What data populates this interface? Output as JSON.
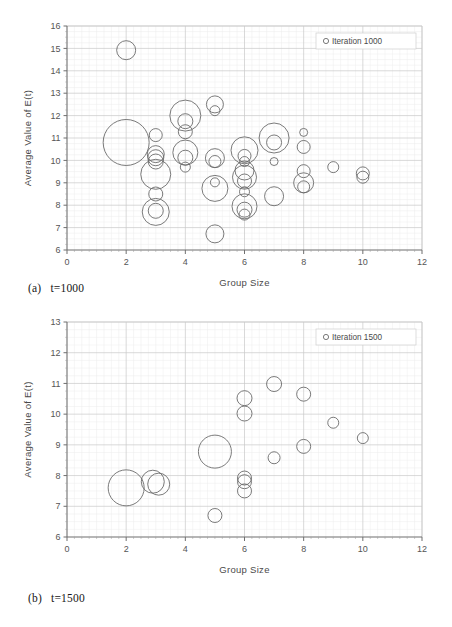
{
  "figure": {
    "panels": [
      {
        "id": "a",
        "caption_index": "(a)",
        "caption_text": "t=1000"
      },
      {
        "id": "b",
        "caption_index": "(b)",
        "caption_text": "t=1500"
      }
    ]
  },
  "chart_data": [
    {
      "type": "scatter",
      "title": "",
      "subtitle": "",
      "xlabel": "Group Size",
      "ylabel": "Average Value of E(t)",
      "xlim": [
        0,
        12
      ],
      "ylim": [
        6,
        16
      ],
      "xticks": [
        0,
        2,
        4,
        6,
        8,
        10,
        12
      ],
      "yticks": [
        6,
        7,
        8,
        9,
        10,
        11,
        12,
        13,
        14,
        15,
        16
      ],
      "grid": true,
      "minor_grid": true,
      "legend": [
        "Iteration 1000"
      ],
      "legend_position": "top-right",
      "marker": "open-circle",
      "series": [
        {
          "name": "Iteration 1000",
          "points": [
            {
              "x": 2,
              "y": 14.92,
              "r": 9.5
            },
            {
              "x": 2,
              "y": 10.8,
              "r": 23.0
            },
            {
              "x": 3,
              "y": 11.13,
              "r": 6.5
            },
            {
              "x": 3,
              "y": 10.28,
              "r": 8.5
            },
            {
              "x": 3,
              "y": 10.12,
              "r": 8.0
            },
            {
              "x": 3,
              "y": 9.95,
              "r": 7.5
            },
            {
              "x": 3,
              "y": 9.38,
              "r": 15.0
            },
            {
              "x": 3,
              "y": 8.5,
              "r": 7.0
            },
            {
              "x": 3,
              "y": 7.75,
              "r": 7.5
            },
            {
              "x": 3,
              "y": 7.7,
              "r": 13.5
            },
            {
              "x": 4,
              "y": 12.0,
              "r": 15.5
            },
            {
              "x": 4,
              "y": 11.75,
              "r": 7.5
            },
            {
              "x": 4,
              "y": 11.28,
              "r": 7.0
            },
            {
              "x": 4,
              "y": 10.35,
              "r": 12.5
            },
            {
              "x": 4,
              "y": 10.12,
              "r": 7.5
            },
            {
              "x": 4,
              "y": 9.7,
              "r": 5.0
            },
            {
              "x": 5,
              "y": 12.5,
              "r": 8.5
            },
            {
              "x": 5,
              "y": 12.22,
              "r": 5.0
            },
            {
              "x": 5,
              "y": 10.1,
              "r": 9.5
            },
            {
              "x": 5,
              "y": 9.95,
              "r": 6.0
            },
            {
              "x": 5,
              "y": 8.75,
              "r": 13.0
            },
            {
              "x": 5,
              "y": 9.02,
              "r": 4.5
            },
            {
              "x": 5,
              "y": 6.72,
              "r": 9.0
            },
            {
              "x": 6,
              "y": 10.45,
              "r": 13.5
            },
            {
              "x": 6,
              "y": 10.2,
              "r": 6.5
            },
            {
              "x": 6,
              "y": 9.95,
              "r": 5.0
            },
            {
              "x": 6,
              "y": 9.55,
              "r": 9.5
            },
            {
              "x": 6,
              "y": 9.25,
              "r": 12.0
            },
            {
              "x": 6,
              "y": 9.08,
              "r": 7.0
            },
            {
              "x": 6,
              "y": 8.6,
              "r": 5.0
            },
            {
              "x": 6,
              "y": 7.95,
              "r": 12.5
            },
            {
              "x": 6,
              "y": 7.8,
              "r": 7.5
            },
            {
              "x": 6,
              "y": 7.58,
              "r": 5.5
            },
            {
              "x": 7,
              "y": 11.0,
              "r": 15.0
            },
            {
              "x": 7,
              "y": 10.8,
              "r": 7.5
            },
            {
              "x": 7,
              "y": 9.95,
              "r": 4.0
            },
            {
              "x": 7,
              "y": 8.4,
              "r": 9.5
            },
            {
              "x": 8,
              "y": 11.25,
              "r": 4.0
            },
            {
              "x": 8,
              "y": 10.6,
              "r": 6.5
            },
            {
              "x": 8,
              "y": 9.52,
              "r": 6.5
            },
            {
              "x": 8,
              "y": 9.0,
              "r": 10.0
            },
            {
              "x": 8,
              "y": 8.82,
              "r": 6.0
            },
            {
              "x": 9,
              "y": 9.7,
              "r": 5.5
            },
            {
              "x": 10,
              "y": 9.42,
              "r": 6.5
            },
            {
              "x": 10,
              "y": 9.25,
              "r": 6.0
            }
          ]
        }
      ]
    },
    {
      "type": "scatter",
      "title": "",
      "subtitle": "",
      "xlabel": "Group Size",
      "ylabel": "Average Value of E(t)",
      "xlim": [
        0,
        12
      ],
      "ylim": [
        6,
        13
      ],
      "xticks": [
        0,
        2,
        4,
        6,
        8,
        10,
        12
      ],
      "yticks": [
        6,
        7,
        8,
        9,
        10,
        11,
        12,
        13
      ],
      "grid": true,
      "minor_grid": true,
      "legend": [
        "Iteration 1500"
      ],
      "legend_position": "top-right",
      "marker": "open-circle",
      "series": [
        {
          "name": "Iteration 1500",
          "points": [
            {
              "x": 2,
              "y": 7.6,
              "r": 18.0
            },
            {
              "x": 2.9,
              "y": 7.8,
              "r": 11.5
            },
            {
              "x": 3.1,
              "y": 7.72,
              "r": 11.0
            },
            {
              "x": 5,
              "y": 8.78,
              "r": 16.5
            },
            {
              "x": 5,
              "y": 6.7,
              "r": 7.0
            },
            {
              "x": 6,
              "y": 10.52,
              "r": 7.5
            },
            {
              "x": 6,
              "y": 10.02,
              "r": 7.5
            },
            {
              "x": 6,
              "y": 7.92,
              "r": 7.0
            },
            {
              "x": 6,
              "y": 7.8,
              "r": 7.0
            },
            {
              "x": 6,
              "y": 7.5,
              "r": 7.0
            },
            {
              "x": 7,
              "y": 10.98,
              "r": 7.5
            },
            {
              "x": 7,
              "y": 8.58,
              "r": 6.0
            },
            {
              "x": 8,
              "y": 10.65,
              "r": 7.0
            },
            {
              "x": 8,
              "y": 8.95,
              "r": 7.0
            },
            {
              "x": 9,
              "y": 9.72,
              "r": 5.5
            },
            {
              "x": 10,
              "y": 9.22,
              "r": 5.5
            }
          ]
        }
      ]
    }
  ]
}
